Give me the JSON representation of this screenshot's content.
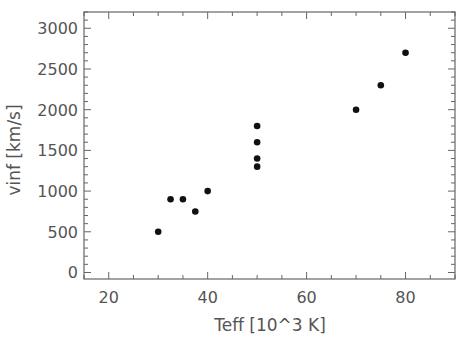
{
  "chart_data": {
    "type": "scatter",
    "title": "",
    "xlabel": "Teff [10^3 K]",
    "ylabel": "vinf [km/s]",
    "xlim": [
      15,
      90
    ],
    "ylim": [
      -80,
      3200
    ],
    "xticks": [
      20,
      40,
      60,
      80
    ],
    "xtick_labels": [
      "20",
      "40",
      "60",
      "80"
    ],
    "yticks": [
      0,
      500,
      1000,
      1500,
      2000,
      2500,
      3000
    ],
    "ytick_labels": [
      "0",
      "500",
      "1000",
      "1500",
      "2000",
      "2500",
      "3000"
    ],
    "grid": false,
    "legend": null,
    "marker_color": "#111111",
    "axis_color": "#666666",
    "points": [
      {
        "x": 30,
        "y": 500
      },
      {
        "x": 32.5,
        "y": 900
      },
      {
        "x": 35,
        "y": 900
      },
      {
        "x": 37.5,
        "y": 750
      },
      {
        "x": 40,
        "y": 1000
      },
      {
        "x": 50,
        "y": 1300
      },
      {
        "x": 50,
        "y": 1400
      },
      {
        "x": 50,
        "y": 1600
      },
      {
        "x": 50,
        "y": 1800
      },
      {
        "x": 70,
        "y": 2000
      },
      {
        "x": 75,
        "y": 2300
      },
      {
        "x": 80,
        "y": 2700
      }
    ]
  }
}
